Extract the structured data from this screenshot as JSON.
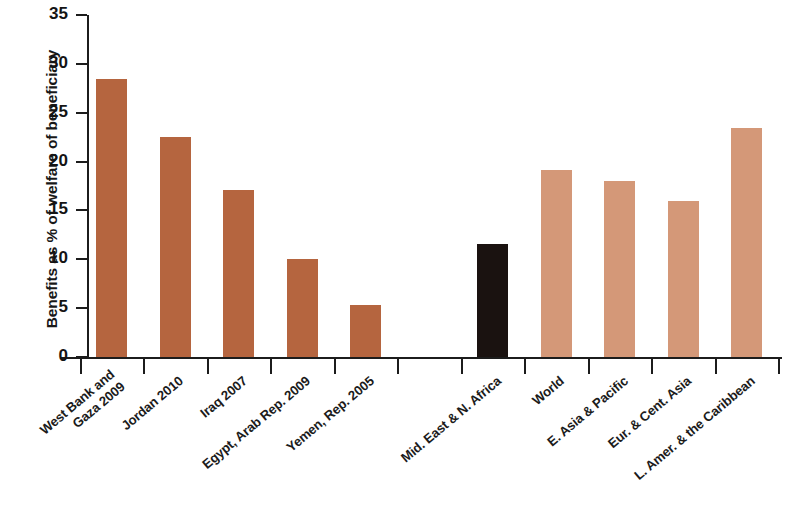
{
  "chart_data": {
    "type": "bar",
    "title": "",
    "xlabel": "",
    "ylabel": "Benefits as % of welfare of beneficiary",
    "ylim": [
      0,
      35
    ],
    "ytick_labels": [
      "0",
      "5",
      "10",
      "15",
      "20",
      "25",
      "30",
      "35"
    ],
    "ytick_values": [
      0,
      5,
      10,
      15,
      20,
      25,
      30,
      35
    ],
    "grid": false,
    "legend": "none",
    "colors": {
      "country_bar": "#b5653f",
      "region_highlight_bar": "#1a1210",
      "comparator_bar": "#d49878",
      "axis": "#1c1c1c",
      "text": "#171717",
      "background": "#ffffff"
    },
    "categories": [
      "West Bank and Gaza 2009",
      "Jordan 2010",
      "Iraq 2007",
      "Egypt, Arab Rep. 2009",
      "Yemen, Rep. 2005",
      "",
      "Mid. East & N. Africa",
      "World",
      "E. Asia & Pacific",
      "Eur. & Cent. Asia",
      "L. Amer. & the Caribbean"
    ],
    "values": [
      28.5,
      22.5,
      17.1,
      10.0,
      5.3,
      null,
      11.6,
      19.1,
      18.0,
      16.0,
      23.4
    ],
    "bars": [
      {
        "label_lines": [
          "West Bank and",
          "Gaza 2009"
        ],
        "value": 28.5,
        "group": "country",
        "color": "#b5653f"
      },
      {
        "label_lines": [
          "Jordan 2010"
        ],
        "value": 22.5,
        "group": "country",
        "color": "#b5653f"
      },
      {
        "label_lines": [
          "Iraq 2007"
        ],
        "value": 17.1,
        "group": "country",
        "color": "#b5653f"
      },
      {
        "label_lines": [
          "Egypt, Arab Rep. 2009"
        ],
        "value": 10.0,
        "group": "country",
        "color": "#b5653f"
      },
      {
        "label_lines": [
          "Yemen, Rep. 2005"
        ],
        "value": 5.3,
        "group": "country",
        "color": "#b5653f"
      },
      {
        "label_lines": [
          ""
        ],
        "value": null,
        "group": "spacer",
        "color": "transparent"
      },
      {
        "label_lines": [
          "Mid. East & N. Africa"
        ],
        "value": 11.6,
        "group": "region-highlight",
        "color": "#1a1210"
      },
      {
        "label_lines": [
          "World"
        ],
        "value": 19.1,
        "group": "comparator",
        "color": "#d49878"
      },
      {
        "label_lines": [
          "E. Asia & Pacific"
        ],
        "value": 18.0,
        "group": "comparator",
        "color": "#d49878"
      },
      {
        "label_lines": [
          "Eur. & Cent. Asia"
        ],
        "value": 16.0,
        "group": "comparator",
        "color": "#d49878"
      },
      {
        "label_lines": [
          "L. Amer. & the Caribbean"
        ],
        "value": 23.4,
        "group": "comparator",
        "color": "#d49878"
      }
    ]
  }
}
